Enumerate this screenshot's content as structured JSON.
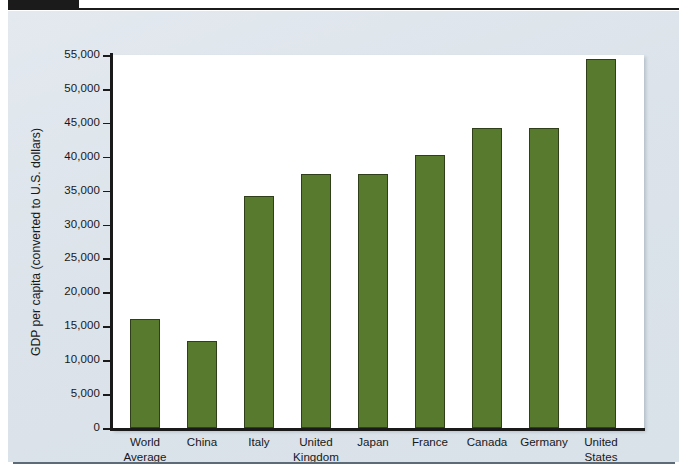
{
  "figure": {
    "background_color": "#dfe5ec",
    "plot_background_color": "#ffffff",
    "bar_color": "#577a2e",
    "bar_edge_color": "#2e3f1a",
    "axis_color": "#1a1a1a"
  },
  "chart_data": {
    "type": "bar",
    "title": "",
    "xlabel": "",
    "ylabel": "GDP per capita (converted to U.S. dollars)",
    "categories": [
      "World\nAverage",
      "China",
      "Italy",
      "United\nKingdom",
      "Japan",
      "France",
      "Canada",
      "Germany",
      "United\nStates"
    ],
    "values": [
      16000,
      12800,
      34200,
      37500,
      37500,
      40200,
      44200,
      44300,
      54400
    ],
    "ylim": [
      0,
      55000
    ],
    "ytick_values": [
      0,
      5000,
      10000,
      15000,
      20000,
      25000,
      30000,
      35000,
      40000,
      45000,
      50000,
      55000
    ],
    "ytick_labels": [
      "0",
      "5,000",
      "10,000",
      "15,000",
      "20,000",
      "25,000",
      "30,000",
      "35,000",
      "40,000",
      "45,000",
      "50,000",
      "55,000"
    ],
    "grid": false,
    "legend": null,
    "legend_position": "none"
  }
}
